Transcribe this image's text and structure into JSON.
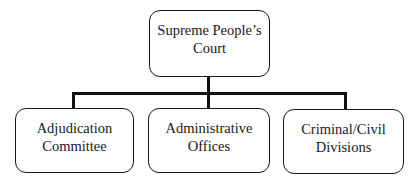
{
  "diagram": {
    "type": "org-chart",
    "root": {
      "label_lines": [
        "Supreme People’s",
        "Court"
      ]
    },
    "children": [
      {
        "label_lines": [
          "Adjudication",
          "Committee"
        ]
      },
      {
        "label_lines": [
          "Administrative",
          "Offices"
        ]
      },
      {
        "label_lines": [
          "Criminal/Civil",
          "Divisions"
        ]
      }
    ],
    "colors": {
      "stroke": "#1a1a1a",
      "fill": "#ffffff",
      "background": "#ffffff"
    }
  }
}
